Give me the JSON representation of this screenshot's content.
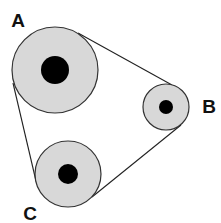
{
  "diagram": {
    "title": "",
    "colors": {
      "pulley_fill": "#d8d8d8",
      "pulley_stroke": "#333333",
      "hub_fill": "#000000",
      "belt_stroke": "#222222",
      "label_color": "#111111",
      "background": "#ffffff"
    },
    "pulleys": [
      {
        "id": "A",
        "label": "A",
        "cx": 55,
        "cy": 70,
        "r": 43,
        "hub_r": 14,
        "label_x": 18,
        "label_y": 27
      },
      {
        "id": "B",
        "label": "B",
        "cx": 166,
        "cy": 107,
        "r": 23,
        "hub_r": 7,
        "label_x": 209,
        "label_y": 113
      },
      {
        "id": "C",
        "label": "C",
        "cx": 68,
        "cy": 174,
        "r": 33,
        "hub_r": 10,
        "label_x": 30,
        "label_y": 220
      }
    ],
    "belt_segments": [
      {
        "from": "A",
        "to": "B",
        "x1": 78,
        "y1": 33,
        "x2": 172,
        "y2": 85
      },
      {
        "from": "A",
        "to": "C",
        "x1": 13,
        "y1": 83,
        "x2": 36,
        "y2": 181
      },
      {
        "from": "C",
        "to": "B",
        "x1": 92,
        "y1": 197,
        "x2": 181,
        "y2": 125
      }
    ]
  }
}
